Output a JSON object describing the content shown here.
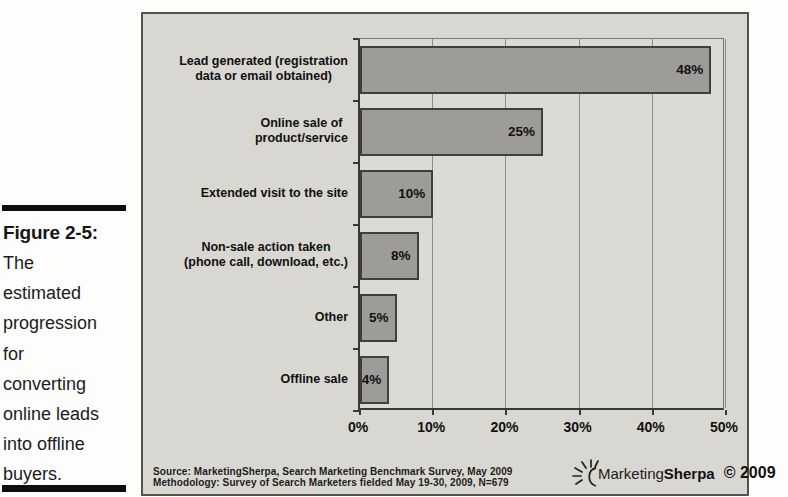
{
  "figure_caption": {
    "label": "Figure 2-5:",
    "text": "The\nestimated\nprogression\nfor\nconverting\nonline leads\ninto offline\nbuyers."
  },
  "chart_data": {
    "type": "bar",
    "orientation": "horizontal",
    "title": "",
    "categories": [
      "Lead generated (registration\ndata or email obtained)",
      "Online sale of\nproduct/service",
      "Extended visit to the site",
      "Non-sale action taken\n(phone call, download, etc.)",
      "Other",
      "Offline sale"
    ],
    "values": [
      48,
      25,
      10,
      8,
      5,
      4
    ],
    "value_labels": [
      "48%",
      "25%",
      "10%",
      "8%",
      "5%",
      "4%"
    ],
    "xlim": [
      0,
      50
    ],
    "x_tick_labels": [
      "0%",
      "10%",
      "20%",
      "30%",
      "40%",
      "50%"
    ],
    "grid": true,
    "legend": "none",
    "colors": {
      "bar_fill": "#9d9c98",
      "bar_border": "#403f3b",
      "panel_bg": "#d8d7d2",
      "gridline": "#908e86"
    }
  },
  "source_note": {
    "line1": "Source: MarketingSherpa, Search Marketing Benchmark Survey, May 2009",
    "line2": "Methodology: Survey of Search Marketers fielded May 19-30, 2009, N=679"
  },
  "branding": {
    "icon": "sunburst-icon",
    "name_regular": "Marketing",
    "name_bold": "Sherpa",
    "copyright": "© 2009"
  }
}
